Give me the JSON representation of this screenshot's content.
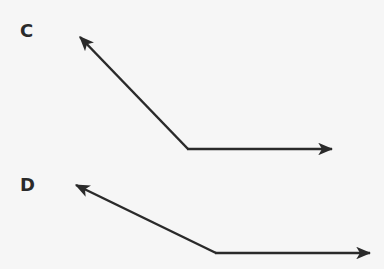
{
  "figures": [
    {
      "label": "C",
      "label_pos": [
        20,
        20
      ],
      "vertex": [
        188,
        149
      ],
      "ray1_tip": [
        80,
        37
      ],
      "ray2_tip": [
        332,
        149
      ]
    },
    {
      "label": "D",
      "label_pos": [
        20,
        174
      ],
      "vertex": [
        216,
        253
      ],
      "ray1_tip": [
        76,
        185
      ],
      "ray2_tip": [
        370,
        253
      ]
    }
  ],
  "colors": {
    "stroke": "#2a2a2a",
    "background": "#f6f6f6"
  }
}
